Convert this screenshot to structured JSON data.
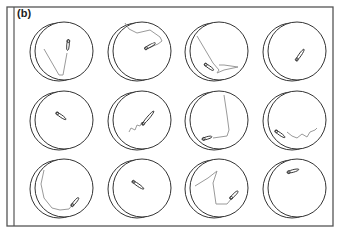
{
  "figure": {
    "panel_label": "(b)",
    "colors": {
      "frame": "#555555",
      "well_outline": "#333333",
      "trajectory": "#9a9a9a",
      "animal_body": "#333333",
      "background": "#ffffff"
    },
    "frame": {
      "x": 7,
      "y": 7,
      "w": 326,
      "h": 219,
      "inner_line_x": 14
    },
    "well": {
      "radius": 29,
      "back_offset_x": -5,
      "back_offset_y": 1
    },
    "grid": {
      "columns": [
        64,
        142,
        219,
        297
      ],
      "rows": [
        51,
        120,
        188
      ]
    },
    "wells": [
      {
        "row": 0,
        "col": 0,
        "trajectory": [
          [
            -20,
            -2
          ],
          [
            -5,
            24
          ],
          [
            -1,
            24
          ],
          [
            3,
            2
          ]
        ],
        "animal": {
          "x": 4,
          "y": -6,
          "angle": 95,
          "len": 11
        }
      },
      {
        "row": 0,
        "col": 1,
        "trajectory": [
          [
            -17,
            -28
          ],
          [
            -13,
            -22
          ],
          [
            -5,
            -18
          ],
          [
            8,
            -21
          ],
          [
            18,
            -14
          ],
          [
            20,
            -10
          ],
          [
            16,
            -7
          ],
          [
            4,
            -2
          ]
        ],
        "animal": {
          "x": 8,
          "y": -5,
          "angle": -30,
          "len": 12
        }
      },
      {
        "row": 0,
        "col": 2,
        "trajectory": [
          [
            -22,
            -15
          ],
          [
            -6,
            12
          ],
          [
            0,
            19
          ],
          [
            -2,
            22
          ],
          [
            5,
            19
          ],
          [
            19,
            16
          ],
          [
            5,
            14
          ],
          [
            0,
            14
          ]
        ],
        "animal": {
          "x": -10,
          "y": 16,
          "angle": 35,
          "len": 11
        }
      },
      {
        "row": 0,
        "col": 3,
        "trajectory": [],
        "animal": {
          "x": 3,
          "y": 4,
          "angle": -55,
          "len": 14
        }
      },
      {
        "row": 1,
        "col": 0,
        "trajectory": [],
        "animal": {
          "x": -3,
          "y": -4,
          "angle": 35,
          "len": 12
        }
      },
      {
        "row": 1,
        "col": 1,
        "trajectory": [
          [
            -13,
            12
          ],
          [
            -11,
            8
          ],
          [
            -7,
            10
          ],
          [
            -5,
            5
          ],
          [
            -2,
            6
          ],
          [
            0,
            2
          ]
        ],
        "animal": {
          "x": 6,
          "y": -2,
          "angle": -50,
          "len": 18
        }
      },
      {
        "row": 1,
        "col": 2,
        "trajectory": [
          [
            -6,
            18
          ],
          [
            8,
            16
          ],
          [
            10,
            10
          ],
          [
            8,
            -5
          ],
          [
            5,
            -25
          ]
        ],
        "animal": {
          "x": -12,
          "y": 18,
          "angle": -15,
          "len": 10
        }
      },
      {
        "row": 1,
        "col": 3,
        "trajectory": [
          [
            -10,
            12
          ],
          [
            -5,
            16
          ],
          [
            0,
            18
          ],
          [
            5,
            14
          ],
          [
            10,
            17
          ],
          [
            13,
            12
          ],
          [
            18,
            10
          ],
          [
            20,
            8
          ]
        ],
        "animal": {
          "x": -17,
          "y": 14,
          "angle": 35,
          "len": 12
        }
      },
      {
        "row": 2,
        "col": 0,
        "trajectory": [
          [
            -20,
            -18
          ],
          [
            -23,
            -4
          ],
          [
            -20,
            10
          ],
          [
            -12,
            20
          ],
          [
            -4,
            22
          ],
          [
            5,
            21
          ],
          [
            9,
            16
          ]
        ],
        "animal": {
          "x": 11,
          "y": 14,
          "angle": -50,
          "len": 11
        }
      },
      {
        "row": 2,
        "col": 1,
        "trajectory": [],
        "animal": {
          "x": -4,
          "y": -3,
          "angle": 35,
          "len": 14
        }
      },
      {
        "row": 2,
        "col": 2,
        "trajectory": [
          [
            -24,
            -2
          ],
          [
            -11,
            -10
          ],
          [
            -2,
            -17
          ],
          [
            -6,
            -5
          ],
          [
            -3,
            16
          ],
          [
            8,
            16
          ],
          [
            13,
            10
          ]
        ],
        "animal": {
          "x": 15,
          "y": 7,
          "angle": -45,
          "len": 11
        }
      },
      {
        "row": 2,
        "col": 3,
        "trajectory": [],
        "animal": {
          "x": -4,
          "y": -17,
          "angle": -15,
          "len": 12
        }
      }
    ]
  }
}
